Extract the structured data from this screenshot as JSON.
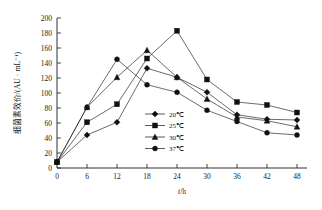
{
  "chart_data": {
    "type": "line",
    "title": "",
    "subtitle": "",
    "xlabel": "t/h",
    "ylabel": "细菌素效价/(AU · mL⁻¹)",
    "x": [
      0,
      6,
      12,
      18,
      24,
      30,
      36,
      42,
      48
    ],
    "xticks": [
      "0",
      "6",
      "12",
      "18",
      "24",
      "30",
      "36",
      "42",
      "48"
    ],
    "yticks": [
      "0",
      "20",
      "40",
      "60",
      "80",
      "100",
      "120",
      "140",
      "160",
      "180",
      "200"
    ],
    "xlim": [
      0,
      50
    ],
    "ylim": [
      0,
      200
    ],
    "grid": false,
    "legend_position": "center",
    "series": [
      {
        "name": "20℃",
        "marker": "diamond",
        "color": "#111111",
        "values": [
          8,
          44,
          61,
          133,
          121,
          101,
          71,
          65,
          64
        ]
      },
      {
        "name": "25℃",
        "marker": "square",
        "color": "#111111",
        "values": [
          8,
          61,
          85,
          146,
          183,
          118,
          88,
          84,
          74
        ]
      },
      {
        "name": "30℃",
        "marker": "triangle",
        "color": "#111111",
        "values": [
          8,
          81,
          121,
          157,
          121,
          92,
          68,
          63,
          55
        ]
      },
      {
        "name": "37℃",
        "marker": "circle",
        "color": "#111111",
        "values": [
          8,
          81,
          145,
          111,
          101,
          77,
          62,
          47,
          44
        ]
      }
    ]
  },
  "axes": {
    "x_axis_title": "t/h",
    "y_axis_title": "细菌素效价/(AU · mL⁻¹)"
  },
  "legend": {
    "items": [
      {
        "label": "20℃",
        "marker": "diamond"
      },
      {
        "label": "25℃",
        "marker": "square"
      },
      {
        "label": "30℃",
        "marker": "triangle"
      },
      {
        "label": "37℃",
        "marker": "circle"
      }
    ]
  },
  "colors": {
    "ink": "#1a1a1a",
    "background": "#ffffff",
    "marker": "#111111"
  }
}
